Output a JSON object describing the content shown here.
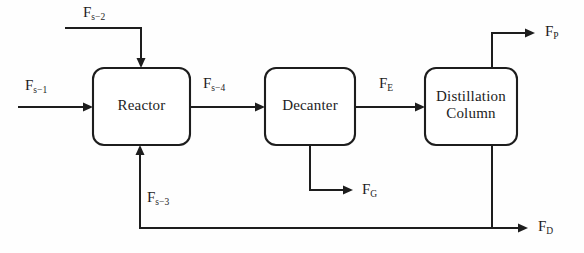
{
  "diagram": {
    "type": "process-flow-diagram",
    "canvas": {
      "width": 584,
      "height": 253
    },
    "background_color": "#fefefe",
    "line_color": "#141414",
    "units": [
      {
        "id": "reactor",
        "label": "Reactor",
        "x": 93,
        "y": 68,
        "width": 97,
        "height": 77
      },
      {
        "id": "decanter",
        "label": "Decanter",
        "x": 265,
        "y": 68,
        "width": 90,
        "height": 77
      },
      {
        "id": "distillation-column",
        "label": "Distillation\nColumn",
        "x": 425,
        "y": 68,
        "width": 92,
        "height": 77
      }
    ],
    "streams": [
      {
        "id": "fs1",
        "base": "F",
        "subscript": "s−1",
        "label": "F s−1",
        "from": "feed",
        "to": "reactor"
      },
      {
        "id": "fs2",
        "base": "F",
        "subscript": "s−2",
        "label": "F s−2",
        "from": "feed",
        "to": "reactor"
      },
      {
        "id": "fs4",
        "base": "F",
        "subscript": "s−4",
        "label": "F s−4",
        "from": "reactor",
        "to": "decanter"
      },
      {
        "id": "fe",
        "base": "F",
        "subscript": "E",
        "label": "F E",
        "from": "decanter",
        "to": "distillation-column"
      },
      {
        "id": "fg",
        "base": "F",
        "subscript": "G",
        "label": "F G",
        "from": "decanter",
        "to": "outlet"
      },
      {
        "id": "fp",
        "base": "F",
        "subscript": "P",
        "label": "F P",
        "from": "distillation-column",
        "to": "outlet"
      },
      {
        "id": "fd",
        "base": "F",
        "subscript": "D",
        "label": "F D",
        "from": "distillation-column",
        "to": "outlet"
      },
      {
        "id": "fs3",
        "base": "F",
        "subscript": "s−3",
        "label": "F s−3",
        "from": "distillation-column",
        "to": "reactor"
      }
    ]
  }
}
